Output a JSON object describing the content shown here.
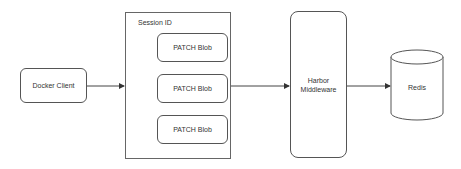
{
  "diagram": {
    "nodes": {
      "docker_client": {
        "label": "Docker Client"
      },
      "session": {
        "label": "Session ID",
        "children": [
          {
            "label": "PATCH Blob"
          },
          {
            "label": "PATCH Blob"
          },
          {
            "label": "PATCH Blob"
          }
        ]
      },
      "harbor_middleware": {
        "label": "Harbor\nMiddleware",
        "line1": "Harbor",
        "line2": "Middleware"
      },
      "redis": {
        "label": "Redis",
        "shape": "cylinder"
      }
    },
    "edges": [
      {
        "from": "Docker Client",
        "to": "Session ID"
      },
      {
        "from": "Session ID",
        "to": "Harbor Middleware"
      },
      {
        "from": "Harbor Middleware",
        "to": "Redis"
      }
    ],
    "colors": {
      "stroke": "#555555",
      "background": "#ffffff",
      "text": "#333333"
    }
  }
}
